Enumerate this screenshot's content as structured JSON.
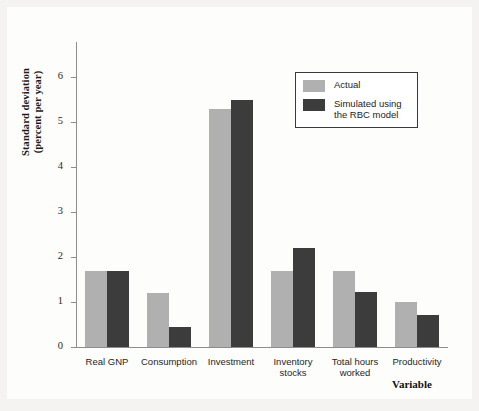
{
  "figure": {
    "y_axis_title_line1": "Standard deviation",
    "y_axis_title_line2": "(percent per year)",
    "x_axis_title": "Variable"
  },
  "legend": {
    "entries": [
      {
        "label": "Actual",
        "color": "#b0b0b0"
      },
      {
        "label": "Simulated using\nthe RBC model",
        "color": "#3c3c3c"
      }
    ]
  },
  "colors": {
    "actual": "#b0b0b0",
    "simulated": "#3c3c3c",
    "axis": "#8d8d8d",
    "page": "#f4f3f1",
    "plot_background": "#fdfdfc"
  },
  "chart_data": {
    "type": "bar",
    "title": "",
    "subtitle": "",
    "xlabel": "Variable",
    "ylabel": "Standard deviation (percent per year)",
    "categories": [
      "Real GNP",
      "Consumption",
      "Investment",
      "Inventory\nstocks",
      "Total hours\nworked",
      "Productivity"
    ],
    "series": [
      {
        "name": "Actual",
        "color": "#b0b0b0",
        "values": [
          1.7,
          1.2,
          5.3,
          1.7,
          1.7,
          1.0
        ]
      },
      {
        "name": "Simulated using the RBC model",
        "color": "#3c3c3c",
        "values": [
          1.7,
          0.45,
          5.5,
          2.2,
          1.22,
          0.72
        ]
      }
    ],
    "ylim": [
      0,
      6.8
    ],
    "yticks": [
      0,
      1,
      2,
      3,
      4,
      5,
      6
    ],
    "ytick_labels": [
      "0",
      "1",
      "2",
      "3",
      "4",
      "5",
      "6"
    ],
    "grid": false,
    "legend_position": "upper right"
  }
}
